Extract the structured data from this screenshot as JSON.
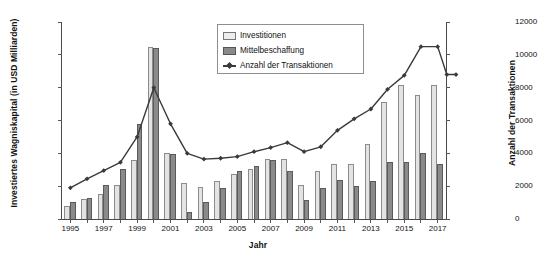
{
  "chart_data": {
    "type": "bar",
    "title": "",
    "xlabel": "Jahr",
    "ylabel": "Investiertes Wagniskapital (in USD Milliarden)",
    "ylabel_right": "Anzahl der Transaktionen",
    "grid": false,
    "legend_position": "top-center",
    "categories": [
      "1995",
      "1996",
      "1997",
      "1998",
      "1999",
      "2000",
      "2001",
      "2002",
      "2003",
      "2004",
      "2005",
      "2006",
      "2007",
      "2008",
      "2009",
      "2010",
      "2011",
      "2012",
      "2013",
      "2014",
      "2015",
      "2016",
      "2017"
    ],
    "xtick_labels": [
      "1995",
      "1997",
      "1999",
      "2001",
      "2003",
      "2005",
      "2007",
      "2009",
      "2011",
      "2013",
      "2015",
      "2017"
    ],
    "ylim": [
      0,
      120
    ],
    "yticks": [
      0,
      20,
      40,
      60,
      80,
      100,
      120
    ],
    "ylim_right": [
      0,
      12000
    ],
    "yticks_right": [
      0,
      2000,
      4000,
      6000,
      8000,
      10000,
      12000
    ],
    "series": [
      {
        "name": "Investitionen",
        "axis": "left",
        "color": "#e3e3e3",
        "values": [
          8,
          12,
          15,
          21,
          36,
          104.5,
          40.5,
          22,
          19.5,
          23,
          27.5,
          30.5,
          36.5,
          36.5,
          20.5,
          29.5,
          33.5,
          33.5,
          45.5,
          71.5,
          81.5,
          75.5,
          81.5
        ]
      },
      {
        "name": "Mittelbeschaffung",
        "axis": "left",
        "color": "#8a8a8a",
        "values": [
          10.5,
          12.5,
          21,
          30.5,
          58,
          104,
          39.5,
          4,
          10.5,
          19,
          29,
          32.5,
          36,
          29.5,
          11.5,
          19,
          23.5,
          20,
          23,
          34.5,
          35,
          40.5,
          33.5
        ]
      },
      {
        "name": "Anzahl der Transaktionen",
        "axis": "right",
        "color": "#3a3a3a",
        "values": [
          1900,
          2450,
          2950,
          3450,
          5000,
          8000,
          5800,
          4000,
          3650,
          3700,
          3800,
          4100,
          4350,
          4650,
          4100,
          4400,
          5400,
          6100,
          6700,
          7900,
          8750,
          10500,
          10500
        ]
      }
    ],
    "line_values_plotted": [
      1900,
      2450,
      2950,
      3450,
      5000,
      8000,
      5800,
      4000,
      3650,
      3700,
      3800,
      4100,
      4350,
      4650,
      4100,
      4400,
      5400,
      6100,
      6700,
      7900,
      8750,
      10500,
      10500,
      8800,
      8800
    ]
  },
  "legend": {
    "items": [
      {
        "label": "Investitionen",
        "type": "swatch-light"
      },
      {
        "label": "Mittelbeschaffung",
        "type": "swatch-dark"
      },
      {
        "label": "Anzahl der Transaktionen",
        "type": "line-marker"
      }
    ]
  },
  "colors": {
    "investitionen": "#e3e3e3",
    "mittelbeschaffung": "#8a8a8a",
    "transaktionen": "#3a3a3a",
    "axis": "#4a4a4a",
    "background": "#ffffff"
  }
}
